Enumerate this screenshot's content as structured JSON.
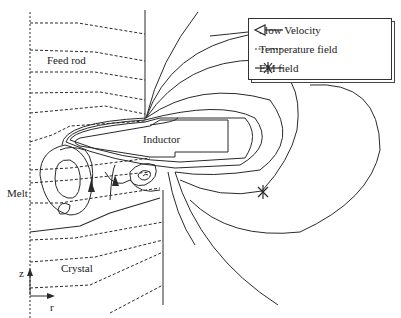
{
  "diagram": {
    "labels": {
      "feed_rod": "Feed rod",
      "inductor": "Inductor",
      "melt": "Melt",
      "crystal": "Crystal",
      "axis_z": "z",
      "axis_r": "r"
    },
    "legend": {
      "items": [
        {
          "label": "Flow Velocity",
          "icon": "open-arrow-line-icon"
        },
        {
          "label": "Temperature field",
          "icon": "dashed-line-icon"
        },
        {
          "label": "EM field",
          "icon": "asterisk-line-icon"
        }
      ]
    },
    "colors": {
      "line": "#2a2a2a",
      "background": "#ffffff"
    }
  }
}
